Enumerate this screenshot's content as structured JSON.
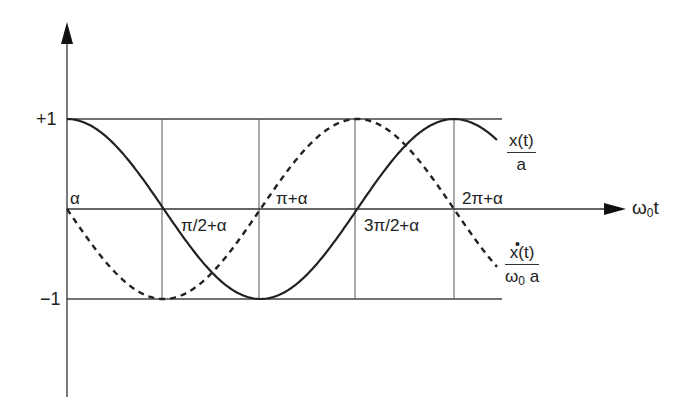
{
  "chart_data": {
    "type": "line",
    "title": "",
    "xlabel": "ω0t",
    "ylabel": "",
    "ylim": [
      -1,
      1
    ],
    "y_ticks": [
      "+1",
      "−1"
    ],
    "x_ticks": [
      "α",
      "π/2+α",
      "π+α",
      "3π/2+α",
      "2π+α"
    ],
    "grid": true,
    "series": [
      {
        "name": "x(t)/a",
        "style": "solid",
        "formula": "cos(ω0t − α)",
        "x": [
          "α",
          "π/2+α",
          "π+α",
          "3π/2+α",
          "2π+α"
        ],
        "values": [
          1,
          0,
          -1,
          0,
          1
        ]
      },
      {
        "name": "ẋ(t)/(ω0 a)",
        "style": "dashed",
        "formula": "−sin(ω0t − α)",
        "x": [
          "α",
          "π/2+α",
          "π+α",
          "3π/2+α",
          "2π+α"
        ],
        "values": [
          0,
          -1,
          0,
          1,
          0
        ]
      }
    ]
  },
  "axes": {
    "y_top": "+1",
    "y_bottom": "−1",
    "x_label_main": "ω",
    "x_label_sub": "0",
    "x_label_tail": "t"
  },
  "ticks": {
    "t0": "α",
    "t1": "π/2+α",
    "t2": "π+α",
    "t3": "3π/2+α",
    "t4": "2π+α"
  },
  "legend": {
    "position": {
      "numerator": "x(t)",
      "denominator": "a"
    },
    "velocity": {
      "dot": "•",
      "numerator": "x(t)",
      "den_main": "ω",
      "den_sub": "0",
      "den_tail": " a"
    }
  },
  "colors": {
    "curve": "#222222",
    "grid": "#555555",
    "axis": "#333333"
  }
}
